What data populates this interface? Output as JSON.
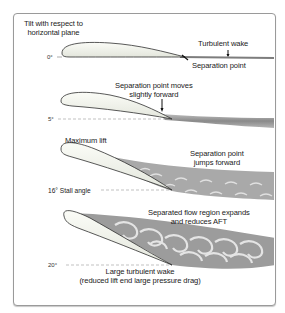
{
  "diagram": {
    "title_line1": "Tilt with respect to",
    "title_line2": "horizontal plane",
    "stages": [
      {
        "angle": "0°",
        "labels": {
          "wake": "Turbulent wake",
          "separation": "Separation point"
        }
      },
      {
        "angle": "5°",
        "labels": {
          "separation_line1": "Separation point moves",
          "separation_line2": "slightly forward"
        }
      },
      {
        "angle": "16° Stall angle",
        "labels": {
          "max_lift": "Maximum lift",
          "separation_line1": "Separation point",
          "separation_line2": "jumps forward"
        }
      },
      {
        "angle": "20°",
        "labels": {
          "region_line1": "Separated flow region expands",
          "region_line2": "and reduces AFT",
          "wake_line1": "Large turbulent wake",
          "wake_line2": "(reduced lift end large pressure drag)"
        }
      }
    ],
    "colors": {
      "frame_border": "#9a9a9a",
      "airfoil_fill": "#f4f6ef",
      "airfoil_stroke": "#333333",
      "wake_dark": "#8c8c8c",
      "wake_light": "#dcdcdc",
      "text": "#1a1a1a",
      "reference_line": "#999999"
    }
  }
}
